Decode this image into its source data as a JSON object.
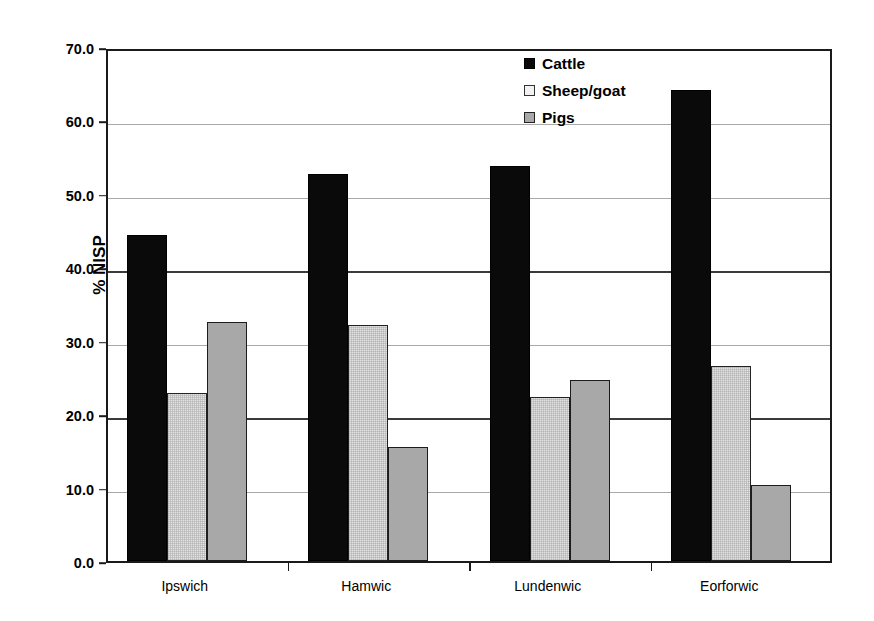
{
  "chart_data": {
    "type": "bar",
    "title": "",
    "subtitle": "",
    "xlabel": "",
    "ylabel": "% NISP",
    "ylim": [
      0.0,
      70.0
    ],
    "ytick_step": 10.0,
    "ytick_labels": [
      "70.0",
      "60.0",
      "50.0",
      "40.0",
      "30.0",
      "20.0",
      "10.0",
      "0.0"
    ],
    "ytick_values": [
      70.0,
      60.0,
      50.0,
      40.0,
      30.0,
      20.0,
      10.0,
      0.0
    ],
    "grid": "horizontal",
    "legend_position": "top-right-inside",
    "categories": [
      "Ipswich",
      "Hamwic",
      "Lundenwic",
      "Eorforwic"
    ],
    "series": [
      {
        "name": "Cattle",
        "color": "#0a0a0a",
        "values": [
          44.4,
          52.7,
          53.8,
          64.2
        ]
      },
      {
        "name": "Sheep/goat",
        "color": "#e2e2e2",
        "values": [
          22.9,
          32.2,
          22.3,
          26.6
        ]
      },
      {
        "name": "Pigs",
        "color": "#a8a8a8",
        "values": [
          32.5,
          15.5,
          24.7,
          10.4
        ]
      }
    ]
  },
  "axis": {
    "y_title": "% NISP"
  },
  "legend": {
    "entries": [
      {
        "label": "Cattle",
        "key": "cattle"
      },
      {
        "label": "Sheep/goat",
        "key": "sheepgoat"
      },
      {
        "label": "Pigs",
        "key": "pigs"
      }
    ]
  }
}
